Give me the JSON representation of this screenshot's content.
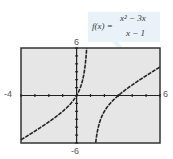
{
  "chart_data": {
    "type": "line",
    "title": "",
    "function_label": "f(x) = (x^2 - 3x)/(x - 1)",
    "xlabel": "",
    "ylabel": "",
    "xlim": [
      -4,
      6
    ],
    "ylim": [
      -6,
      6
    ],
    "tick_labels": {
      "xmin": "-4",
      "xmax": "6",
      "ymax": "6",
      "ymin": "-6"
    },
    "x_tick_step": 1,
    "y_tick_step": 1,
    "vertical_asymptote": 1,
    "slant_asymptote": "y = x - 2",
    "series": [
      {
        "name": "f(x)",
        "branch": "left",
        "x": [
          -4,
          -3,
          -2,
          -1,
          0,
          0.5
        ],
        "y": [
          -5.6,
          -4.5,
          -3.33,
          -2,
          0,
          2.5
        ]
      },
      {
        "name": "f(x)",
        "branch": "right",
        "x": [
          1.3,
          1.5,
          2,
          3,
          4,
          5,
          6
        ],
        "y": [
          -5.4,
          -3.0,
          -2,
          0,
          1.33,
          2.5,
          3.6
        ]
      }
    ],
    "grid": false,
    "legend": "none"
  },
  "formula": {
    "lhs": "f(x) =",
    "num": "x² − 3x",
    "den": "x − 1"
  },
  "colors": {
    "frame": "#333333",
    "background": "#e6e6e6",
    "curve": "#222222",
    "callout": "#e8f2f8"
  }
}
